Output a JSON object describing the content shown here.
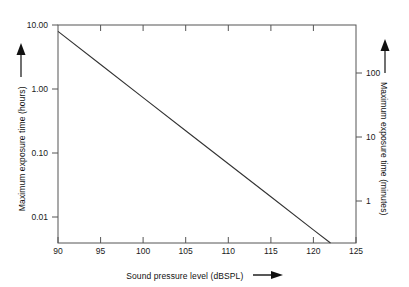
{
  "chart_data": {
    "type": "line",
    "title": "",
    "xlabel": "Sound pressure level (dBSPL)",
    "ylabel": "Maximum exposure time (hours)",
    "y2label": "Maximum exposure time (minutes)",
    "xlim": [
      90,
      125
    ],
    "ylim": [
      0.005,
      10.0
    ],
    "y2lim": [
      0.3,
      600
    ],
    "yscale": "log",
    "y2scale": "log",
    "grid": false,
    "legend": null,
    "xticks": [
      90,
      95,
      100,
      105,
      110,
      115,
      120,
      125
    ],
    "xticklabels": [
      "90",
      "95",
      "100",
      "105",
      "110",
      "115",
      "120",
      "125"
    ],
    "yticks": [
      10.0,
      1.0,
      0.1,
      0.01
    ],
    "yticklabels": [
      "10.00",
      "1.00",
      "0.10",
      "0.01"
    ],
    "y2ticks": [
      100,
      10,
      1
    ],
    "y2ticklabels": [
      "100",
      "10",
      "1"
    ],
    "series": [
      {
        "name": "Maximum exposure time",
        "x": [
          90,
          95,
          100,
          105,
          110,
          115,
          120,
          122
        ],
        "y": [
          8.0,
          2.52,
          0.795,
          0.25,
          0.079,
          0.025,
          0.0079,
          0.005
        ],
        "y_minutes": [
          480,
          151,
          47.7,
          15.0,
          4.74,
          1.5,
          0.47,
          0.3
        ],
        "color": "#333333",
        "linewidth": 1
      }
    ],
    "annotations": {
      "x_axis_arrow": "right-arrow",
      "y_axis_arrow": "up-arrow",
      "y2_axis_arrow": "up-arrow"
    }
  },
  "axes": {
    "left_title": "Maximum exposure time (hours)",
    "right_title": "Maximum exposure time (minutes)",
    "bottom_title": "Sound pressure level (dBSPL)"
  },
  "ticks": {
    "y_left": [
      "10.00",
      "1.00",
      "0.10",
      "0.01"
    ],
    "y_right": [
      "100",
      "10",
      "1"
    ],
    "x": [
      "90",
      "95",
      "100",
      "105",
      "110",
      "115",
      "120",
      "125"
    ]
  },
  "colors": {
    "line": "#333333",
    "axis": "#444444",
    "text": "#111111",
    "background": "#ffffff"
  }
}
